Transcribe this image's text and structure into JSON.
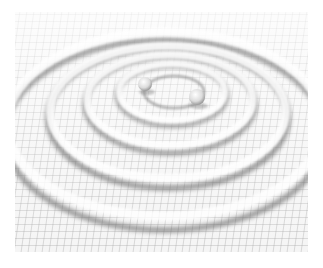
{
  "image": {
    "subject": "gravitational-wave ripples from binary system on spacetime grid",
    "bodies": [
      {
        "name": "body-a",
        "cx": 145,
        "cy": 84,
        "r": 7
      },
      {
        "name": "body-b",
        "cx": 197,
        "cy": 97,
        "r": 8
      }
    ],
    "ripple_center": {
      "x": 170,
      "y": 92
    },
    "colors": {
      "background": "#ffffff",
      "grid": "#8a8a8a",
      "shadow": "#555555",
      "highlight": "#fafafa"
    }
  }
}
